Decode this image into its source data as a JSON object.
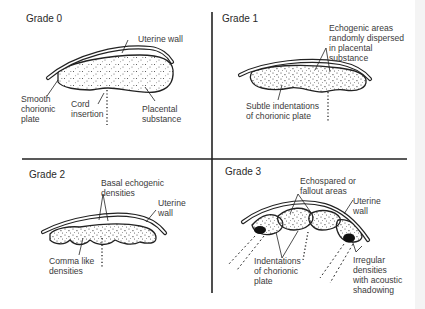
{
  "figure": {
    "type": "placental grading diagram",
    "quadrants": [
      {
        "id": "grade0",
        "title": "Grade 0",
        "labels": {
          "uterine_wall": "Uterine wall",
          "smooth_chorionic_plate": "Smooth\nchorionic\nplate",
          "cord_insertion": "Cord\ninsertion",
          "placental_substance": "Placental\nsubstance"
        }
      },
      {
        "id": "grade1",
        "title": "Grade 1",
        "labels": {
          "echogenic_areas": "Echogenic areas\nrandomly dispersed\nin placental\nsubstance",
          "subtle_indentations": "Subtle indentations\nof chorionic plate"
        }
      },
      {
        "id": "grade2",
        "title": "Grade 2",
        "labels": {
          "basal_echogenic": "Basal echogenic\ndensities",
          "uterine_wall": "Uterine\nwall",
          "comma_like": "Comma like\ndensities"
        }
      },
      {
        "id": "grade3",
        "title": "Grade 3",
        "labels": {
          "echospared": "Echospared or\nfallout areas",
          "uterine_wall": "Uterine\nwall",
          "indentations": "Indentations\nof chorionic\nplate",
          "irregular_densities": "Irregular\ndensities\nwith acoustic\nshadowing"
        }
      }
    ],
    "colors": {
      "line": "#2a2a2a",
      "text": "#3a3a3a",
      "background": "#ffffff"
    }
  }
}
